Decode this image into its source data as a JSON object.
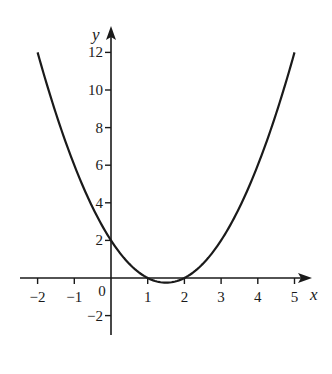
{
  "chart_data": {
    "type": "line",
    "title": "",
    "xlabel": "x",
    "ylabel": "y",
    "function": "y = x^2 - 3x + 2",
    "xlim": [
      -2,
      5
    ],
    "ylim": [
      -2,
      12
    ],
    "x_ticks": [
      -2,
      -1,
      0,
      1,
      2,
      3,
      4,
      5
    ],
    "x_tick_labels": [
      "−2",
      "−1",
      "0",
      "1",
      "2",
      "3",
      "4",
      "5"
    ],
    "y_ticks": [
      -2,
      2,
      4,
      6,
      8,
      10,
      12
    ],
    "y_tick_labels": [
      "−2",
      "2",
      "4",
      "6",
      "8",
      "10",
      "12"
    ],
    "grid": false,
    "legend": null,
    "series": [
      {
        "name": "parabola",
        "x": [
          -2,
          -1.5,
          -1,
          -0.5,
          0,
          0.5,
          1,
          1.5,
          2,
          2.5,
          3,
          3.5,
          4,
          4.5,
          5
        ],
        "y": [
          12,
          8.75,
          6,
          3.75,
          2,
          0.75,
          0,
          -0.25,
          0,
          0.75,
          2,
          3.75,
          6,
          8.75,
          12
        ]
      }
    ],
    "colors": {
      "curve": "#1a1a1a",
      "axes": "#1a1a1a",
      "background": "#ffffff"
    }
  }
}
